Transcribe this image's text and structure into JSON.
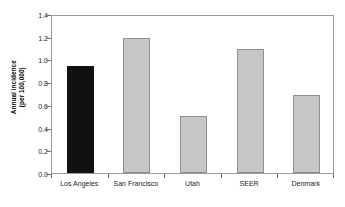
{
  "chart_data": {
    "type": "bar",
    "title": "",
    "xlabel": "",
    "ylabel": "Annual incidence (per 100,000)",
    "ylabel_line1": "Annual incidence",
    "ylabel_line2": "(per 100,000)",
    "categories": [
      "Los Angeles",
      "San Francisco",
      "Utah",
      "SEER",
      "Denmark"
    ],
    "values": [
      0.94,
      1.19,
      0.5,
      1.09,
      0.69
    ],
    "ylim": [
      0.0,
      1.4
    ],
    "ytick_values": [
      0.0,
      0.2,
      0.4,
      0.6,
      0.8,
      1.0,
      1.2,
      1.4
    ],
    "ytick_labels": [
      "0.0",
      "0.2",
      "0.4",
      "0.6",
      "0.8",
      "1.0",
      "1.2",
      "1.4"
    ],
    "grid": false,
    "legend": null,
    "bar_colors": [
      "#111111",
      "#c6c6c6",
      "#c6c6c6",
      "#c6c6c6",
      "#c6c6c6"
    ],
    "highlight_category": "Los Angeles",
    "highlight_color": "#111111",
    "series_color": "#c6c6c6",
    "frame_color": "#9b9b9b",
    "background": "#ffffff"
  }
}
